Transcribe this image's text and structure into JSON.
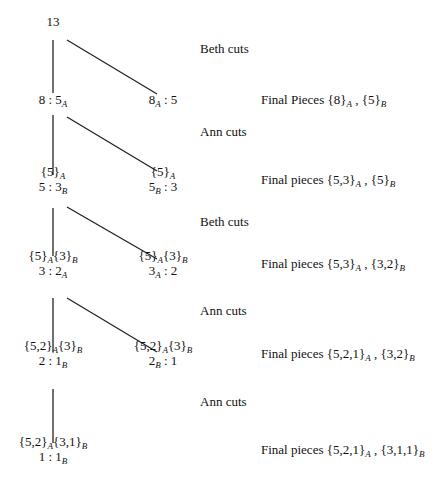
{
  "diagram": {
    "type": "game-tree",
    "nodes": [
      {
        "id": "root",
        "x": 53,
        "y": 21,
        "lines": [
          "13"
        ]
      },
      {
        "id": "n1l",
        "x": 53,
        "y": 99,
        "lines": [
          "8 : 5|A"
        ]
      },
      {
        "id": "n1r",
        "x": 163,
        "y": 99,
        "lines": [
          "8|A : 5"
        ]
      },
      {
        "id": "n2l",
        "x": 53,
        "y": 179,
        "lines": [
          "{5}|A",
          "5 : 3|B"
        ]
      },
      {
        "id": "n2r",
        "x": 163,
        "y": 179,
        "lines": [
          "{5}|A",
          "5|B : 3"
        ]
      },
      {
        "id": "n3l",
        "x": 53,
        "y": 263,
        "lines": [
          "{5}|A{3}|B",
          "3 : 2|A"
        ]
      },
      {
        "id": "n3r",
        "x": 163,
        "y": 263,
        "lines": [
          "{5}|A{3}|B",
          "3|A : 2"
        ]
      },
      {
        "id": "n4l",
        "x": 53,
        "y": 353,
        "lines": [
          "{5,2}|A{3}|B",
          "2 : 1|B"
        ]
      },
      {
        "id": "n4r",
        "x": 163,
        "y": 353,
        "lines": [
          "{5,2}|A{3}|B",
          "2|B : 1"
        ]
      },
      {
        "id": "n5l",
        "x": 53,
        "y": 449,
        "lines": [
          "{5,2}|A{3,1}|B",
          "1 : 1|B"
        ]
      }
    ],
    "edges": [
      {
        "x1": 53,
        "y1": 40,
        "x2": 53,
        "y2": 93
      },
      {
        "x1": 67,
        "y1": 40,
        "x2": 157,
        "y2": 94
      },
      {
        "x1": 53,
        "y1": 115,
        "x2": 53,
        "y2": 175
      },
      {
        "x1": 67,
        "y1": 117,
        "x2": 157,
        "y2": 171
      },
      {
        "x1": 53,
        "y1": 208,
        "x2": 53,
        "y2": 256
      },
      {
        "x1": 67,
        "y1": 207,
        "x2": 157,
        "y2": 259
      },
      {
        "x1": 53,
        "y1": 298,
        "x2": 53,
        "y2": 352
      },
      {
        "x1": 67,
        "y1": 298,
        "x2": 157,
        "y2": 352
      },
      {
        "x1": 53,
        "y1": 389,
        "x2": 53,
        "y2": 443
      }
    ],
    "turn_labels": [
      {
        "x": 200,
        "y": 48,
        "text": "Beth cuts"
      },
      {
        "x": 200,
        "y": 131,
        "text": "Ann cuts"
      },
      {
        "x": 200,
        "y": 221,
        "text": "Beth cuts"
      },
      {
        "x": 200,
        "y": 310,
        "text": "Ann cuts"
      },
      {
        "x": 200,
        "y": 401,
        "text": "Ann cuts"
      }
    ],
    "final_pieces": [
      {
        "x": 261,
        "y": 99,
        "text": "Final Pieces {8}|A , {5}|B"
      },
      {
        "x": 261,
        "y": 179,
        "text": "Final pieces {5,3}|A , {5}|B"
      },
      {
        "x": 261,
        "y": 263,
        "text": "Final pieces {5,3}|A , {3,2}|B"
      },
      {
        "x": 261,
        "y": 353,
        "text": "Final pieces {5,2,1}|A , {3,2}|B"
      },
      {
        "x": 261,
        "y": 449,
        "text": "Final pieces {5,2,1}|A , {3,1,1}|B"
      }
    ],
    "line_color": "#222222"
  }
}
